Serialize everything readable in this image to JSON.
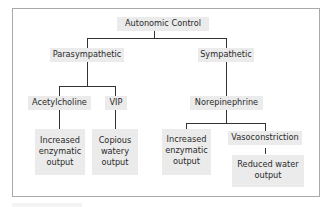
{
  "diagram": {
    "title": "Autonomic Control",
    "branches": [
      {
        "label": "Parasympathetic",
        "children": [
          {
            "label": "Acetylcholine",
            "effect": [
              "Increased",
              "enzymatic",
              "output"
            ]
          },
          {
            "label": "VIP",
            "effect": [
              "Copious",
              "watery",
              "output"
            ]
          }
        ]
      },
      {
        "label": "Sympathetic",
        "children": [
          {
            "label": "Norepinephrine",
            "effects": [
              {
                "label": [
                  "Increased",
                  "enzymatic",
                  "output"
                ]
              },
              {
                "label": [
                  "Vasoconstriction"
                ],
                "effect": [
                  "Reduced water",
                  "output"
                ]
              }
            ]
          }
        ]
      }
    ]
  },
  "colors": {
    "node_bg": "#ebebeb",
    "line": "#333333",
    "frame_border": "#a9a9a9"
  }
}
